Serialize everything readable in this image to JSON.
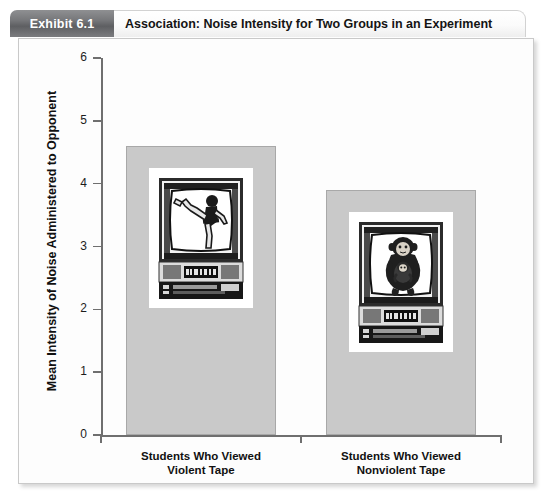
{
  "exhibit": {
    "tab_label": "Exhibit 6.1",
    "title": "Association: Noise Intensity for Two Groups in an Experiment"
  },
  "colors": {
    "bar_fill": "#c9c9c9",
    "bar_stroke": "#a8a8a8",
    "axis": "#6f6f6f",
    "tab_background": "#6f7073",
    "tab_text": "#ffffff",
    "panel_background": "#fdfdfd"
  },
  "chart_data": {
    "type": "bar",
    "title": "Association: Noise Intensity for Two Groups in an Experiment",
    "xlabel": "",
    "ylabel": "Mean Intensity of Noise Administered to Opponent",
    "categories": [
      "Students Who Viewed Violent Tape",
      "Students Who Viewed Nonviolent Tape"
    ],
    "category_lines": [
      [
        "Students Who Viewed",
        "Violent Tape"
      ],
      [
        "Students Who Viewed",
        "Nonviolent Tape"
      ]
    ],
    "values": [
      4.6,
      3.9
    ],
    "ylim": [
      0,
      6
    ],
    "yticks": [
      0,
      1,
      2,
      3,
      4,
      5,
      6
    ],
    "ytick_labels": [
      "0",
      "1",
      "2",
      "3",
      "4",
      "5",
      "6"
    ],
    "grid": false,
    "legend": null,
    "annotations": [
      {
        "icon": "television-with-martial-arts-kick-icon",
        "description": "Television set displaying a person performing a high karate kick",
        "on_bar": 0
      },
      {
        "icon": "television-with-chimpanzee-icon",
        "description": "Television set displaying a chimpanzee holding an infant chimpanzee",
        "on_bar": 1
      }
    ]
  }
}
